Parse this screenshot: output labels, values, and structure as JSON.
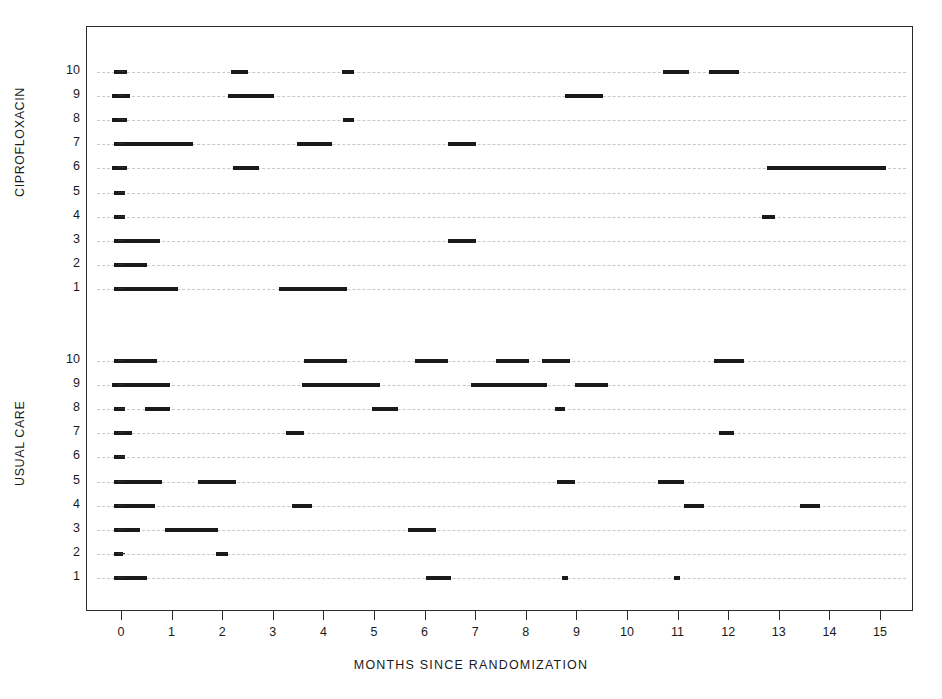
{
  "chart_data": {
    "type": "bar",
    "title": "",
    "xlabel": "MONTHS SINCE RANDOMIZATION",
    "ylabel": "",
    "xlim": [
      -0.35,
      15.6
    ],
    "xticks": [
      0,
      1,
      2,
      3,
      4,
      5,
      6,
      7,
      8,
      9,
      10,
      11,
      12,
      13,
      14,
      15
    ],
    "xticklabels": [
      "0",
      "1",
      "2",
      "3",
      "4",
      "5",
      "6",
      "7",
      "8",
      "9",
      "10",
      "11",
      "12",
      "13",
      "14",
      "15"
    ],
    "grid": true,
    "grid_style": "dashed-horizontal",
    "legend": "none",
    "marker_color": "#1a1a1a",
    "grid_color": "#c9c9c9",
    "axis_color": "#2b2b2b",
    "groups": [
      {
        "name": "CIPROFLOXACIN",
        "subjects": [
          {
            "id": "10",
            "intervals": [
              [
                -0.15,
                0.1
              ],
              [
                2.15,
                2.5
              ],
              [
                4.35,
                4.58
              ],
              [
                10.7,
                11.2
              ],
              [
                11.6,
                12.2
              ]
            ]
          },
          {
            "id": "9",
            "intervals": [
              [
                -0.2,
                0.15
              ],
              [
                2.1,
                3.0
              ],
              [
                8.75,
                9.5
              ]
            ]
          },
          {
            "id": "8",
            "intervals": [
              [
                -0.2,
                0.1
              ],
              [
                4.37,
                4.58
              ]
            ]
          },
          {
            "id": "7",
            "intervals": [
              [
                -0.15,
                1.4
              ],
              [
                3.45,
                4.15
              ],
              [
                6.45,
                7.0
              ]
            ]
          },
          {
            "id": "6",
            "intervals": [
              [
                -0.2,
                0.1
              ],
              [
                2.2,
                2.7
              ],
              [
                12.75,
                15.1
              ]
            ]
          },
          {
            "id": "5",
            "intervals": [
              [
                -0.15,
                0.05
              ]
            ]
          },
          {
            "id": "4",
            "intervals": [
              [
                -0.15,
                0.05
              ],
              [
                12.65,
                12.9
              ]
            ]
          },
          {
            "id": "3",
            "intervals": [
              [
                -0.15,
                0.75
              ],
              [
                6.45,
                7.0
              ]
            ]
          },
          {
            "id": "2",
            "intervals": [
              [
                -0.15,
                0.5
              ]
            ]
          },
          {
            "id": "1",
            "intervals": [
              [
                -0.15,
                1.1
              ],
              [
                3.1,
                4.45
              ]
            ]
          }
        ]
      },
      {
        "name": "USUAL CARE",
        "subjects": [
          {
            "id": "10",
            "intervals": [
              [
                -0.15,
                0.7
              ],
              [
                3.6,
                4.45
              ],
              [
                5.8,
                6.45
              ],
              [
                7.4,
                8.05
              ],
              [
                8.3,
                8.85
              ],
              [
                11.7,
                12.3
              ]
            ]
          },
          {
            "id": "9",
            "intervals": [
              [
                -0.2,
                0.95
              ],
              [
                3.55,
                5.1
              ],
              [
                6.9,
                8.4
              ],
              [
                8.95,
                9.6
              ]
            ]
          },
          {
            "id": "8",
            "intervals": [
              [
                -0.15,
                0.05
              ],
              [
                0.45,
                0.95
              ],
              [
                4.95,
                5.45
              ],
              [
                8.55,
                8.75
              ]
            ]
          },
          {
            "id": "7",
            "intervals": [
              [
                -0.15,
                0.2
              ],
              [
                3.25,
                3.6
              ],
              [
                11.8,
                12.1
              ]
            ]
          },
          {
            "id": "6",
            "intervals": [
              [
                -0.15,
                0.05
              ]
            ]
          },
          {
            "id": "5",
            "intervals": [
              [
                -0.15,
                0.8
              ],
              [
                1.5,
                2.25
              ],
              [
                8.6,
                8.95
              ],
              [
                10.6,
                11.1
              ]
            ]
          },
          {
            "id": "4",
            "intervals": [
              [
                -0.15,
                0.65
              ],
              [
                3.35,
                3.75
              ],
              [
                11.1,
                11.5
              ],
              [
                13.4,
                13.8
              ]
            ]
          },
          {
            "id": "3",
            "intervals": [
              [
                -0.15,
                0.35
              ],
              [
                0.85,
                1.9
              ],
              [
                5.65,
                6.2
              ]
            ]
          },
          {
            "id": "2",
            "intervals": [
              [
                -0.15,
                0.02
              ],
              [
                1.85,
                2.1
              ]
            ]
          },
          {
            "id": "1",
            "intervals": [
              [
                -0.15,
                0.5
              ],
              [
                6.0,
                6.5
              ],
              [
                8.7,
                8.8
              ],
              [
                10.9,
                11.0
              ]
            ]
          }
        ]
      }
    ]
  },
  "axis": {
    "x_title": "MONTHS SINCE RANDOMIZATION"
  }
}
